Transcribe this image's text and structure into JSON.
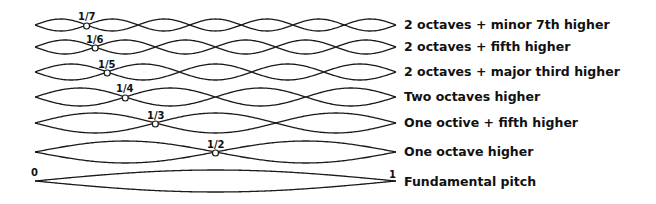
{
  "string": {
    "x_start": 35,
    "x_end": 396,
    "start_label": "0",
    "end_label": "1"
  },
  "harmonics": [
    {
      "n": 7,
      "node_label": "1/7",
      "y": 25,
      "amp": 6,
      "description": "2 octaves + minor 7th higher"
    },
    {
      "n": 6,
      "node_label": "1/6",
      "y": 47,
      "amp": 7,
      "description": "2 octaves + fifth higher"
    },
    {
      "n": 5,
      "node_label": "1/5",
      "y": 72,
      "amp": 8,
      "description": "2 octaves + major third higher"
    },
    {
      "n": 4,
      "node_label": "1/4",
      "y": 97,
      "amp": 9,
      "description": "Two octaves higher"
    },
    {
      "n": 3,
      "node_label": "1/3",
      "y": 123,
      "amp": 10,
      "description": "One octive + fifth higher"
    },
    {
      "n": 2,
      "node_label": "1/2",
      "y": 152,
      "amp": 11,
      "description": "One octave higher"
    },
    {
      "n": 1,
      "node_label": "",
      "y": 181,
      "amp": 11,
      "description": "Fundamental pitch"
    }
  ],
  "colors": {
    "line": "#1a1a1a",
    "background": "#ffffff"
  }
}
